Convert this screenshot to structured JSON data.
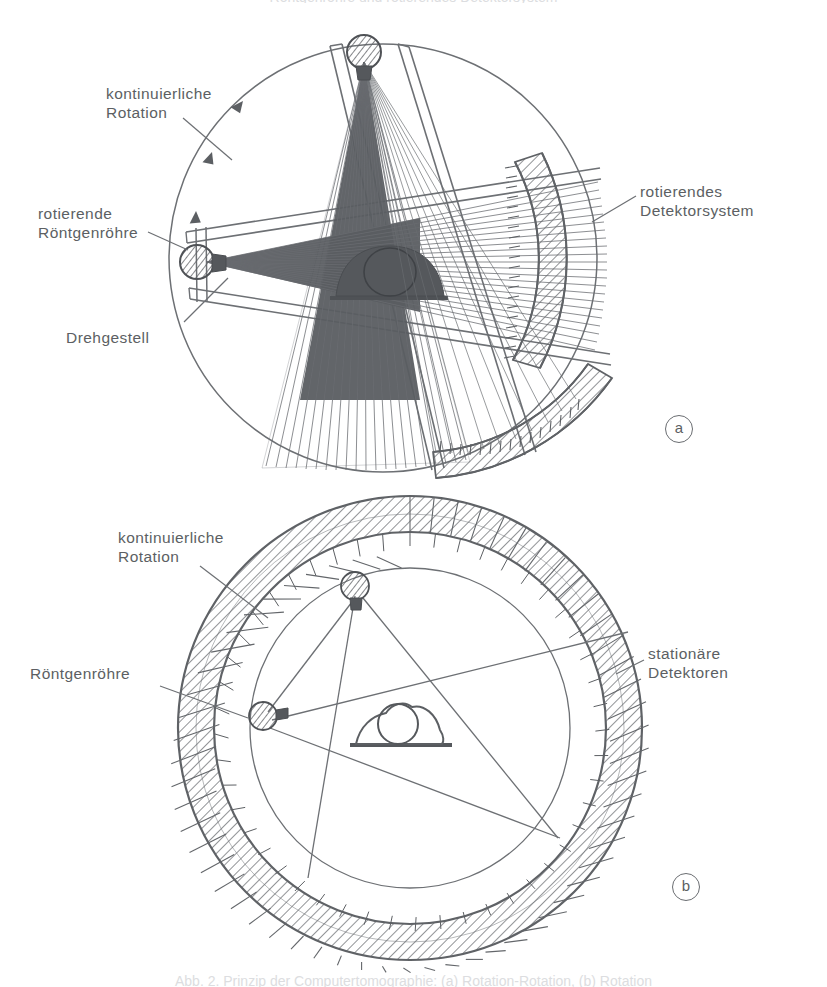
{
  "figure": {
    "kind": "technical-line-drawing",
    "language": "de",
    "background_color": "#ffffff",
    "ink_color": "#5c5f63",
    "fill_dark": "#5a5d61",
    "cut_text_top": "Röntgenröhre und rotierendes Detektorsystem",
    "cut_text_bottom": "Abb. 2. Prinzip der Computertomographie: (a) Rotation-Rotation, (b) Rotation"
  },
  "panels": [
    {
      "id": "a",
      "marker": "a",
      "title": "rotierende Röhre mit rotierendem Detektorsystem",
      "labels": [
        {
          "name": "continuous-rotation",
          "text": "kontinuierliche\nRotation",
          "x": 106,
          "y": 84
        },
        {
          "name": "rotating-xray-tube",
          "text": "rotierende\nRöntgenröhre",
          "x": 38,
          "y": 204
        },
        {
          "name": "rotating-detector-system",
          "text": "rotierendes\nDetektorsystem",
          "x": 640,
          "y": 182
        },
        {
          "name": "rotating-gantry",
          "text": "Drehgestell",
          "x": 66,
          "y": 328
        }
      ]
    },
    {
      "id": "b",
      "marker": "b",
      "title": "rotierende Röhre mit stationärem Detektorring",
      "labels": [
        {
          "name": "continuous-rotation",
          "text": "kontinuierliche\nRotation",
          "x": 118,
          "y": 528
        },
        {
          "name": "xray-tube",
          "text": "Röntgenröhre",
          "x": 30,
          "y": 664
        },
        {
          "name": "stationary-detectors",
          "text": "stationäre\nDetektoren",
          "x": 648,
          "y": 644
        }
      ]
    }
  ],
  "geometry": {
    "panel_a": {
      "gantry_circle": {
        "cx": 383,
        "cy": 258,
        "r": 214
      },
      "tube_top": {
        "cx": 364,
        "cy": 52,
        "r": 16
      },
      "tube_left": {
        "cx": 197,
        "cy": 262,
        "r": 17
      },
      "detector_arc_right": {
        "cx": 383,
        "cy": 258,
        "r_inner": 206,
        "r_outer": 238,
        "a_start": -48,
        "a_end": 34
      },
      "detector_arc_bottom": {
        "cx": 383,
        "cy": 258,
        "r_inner": 206,
        "r_outer": 238,
        "a_start": 52,
        "a_end": 132
      },
      "rotation_arrow_count": 3
    },
    "panel_b": {
      "outer_ring": {
        "cx": 410,
        "cy": 728,
        "r_inner": 196,
        "r_outer": 232
      },
      "inner_circle": {
        "cx": 410,
        "cy": 728,
        "r": 160
      },
      "tube": {
        "cx": 355,
        "cy": 586,
        "r": 14
      },
      "tube_second": {
        "cx": 263,
        "cy": 716,
        "r": 14
      },
      "detector_cell_count": 120,
      "patient": {
        "cx": 398,
        "cy": 737
      }
    }
  }
}
